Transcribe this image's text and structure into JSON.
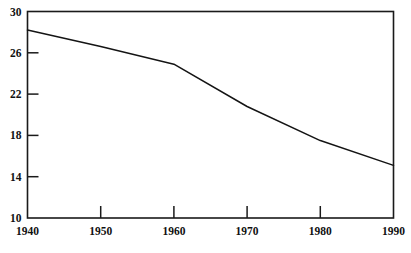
{
  "chart_data": {
    "type": "line",
    "title": "",
    "subtitle": "",
    "xlabel": "",
    "ylabel": "",
    "x": [
      1940,
      1950,
      1960,
      1970,
      1980,
      1990
    ],
    "series": [
      {
        "name": "",
        "values": [
          28.2,
          26.6,
          24.9,
          20.8,
          17.5,
          15.1
        ]
      }
    ],
    "xlim": [
      1940,
      1990
    ],
    "ylim": [
      10,
      30
    ],
    "x_ticks": [
      1940,
      1950,
      1960,
      1970,
      1980,
      1990
    ],
    "x_tick_labels": [
      "1940",
      "1950",
      "1960",
      "1970",
      "1980",
      "1990"
    ],
    "y_ticks": [
      10,
      14,
      18,
      22,
      26,
      30
    ],
    "y_tick_labels": [
      "10",
      "14",
      "18",
      "22",
      "26",
      "30"
    ],
    "grid": false,
    "legend": false,
    "legend_position": "none",
    "frame": "box",
    "tick_direction": "in",
    "line_color": "#141414",
    "frame_color": "#1a1a1a",
    "background_color": "#ffffff",
    "annotations": []
  },
  "axes": {
    "y_labels": [
      {
        "text": "30",
        "value": 30
      },
      {
        "text": "26",
        "value": 26
      },
      {
        "text": "22",
        "value": 22
      },
      {
        "text": "18",
        "value": 18
      },
      {
        "text": "14",
        "value": 14
      },
      {
        "text": "10",
        "value": 10
      }
    ],
    "x_labels": [
      {
        "text": "1940",
        "value": 1940
      },
      {
        "text": "1950",
        "value": 1950
      },
      {
        "text": "1960",
        "value": 1960
      },
      {
        "text": "1970",
        "value": 1970
      },
      {
        "text": "1980",
        "value": 1980
      },
      {
        "text": "1990",
        "value": 1990
      }
    ]
  }
}
